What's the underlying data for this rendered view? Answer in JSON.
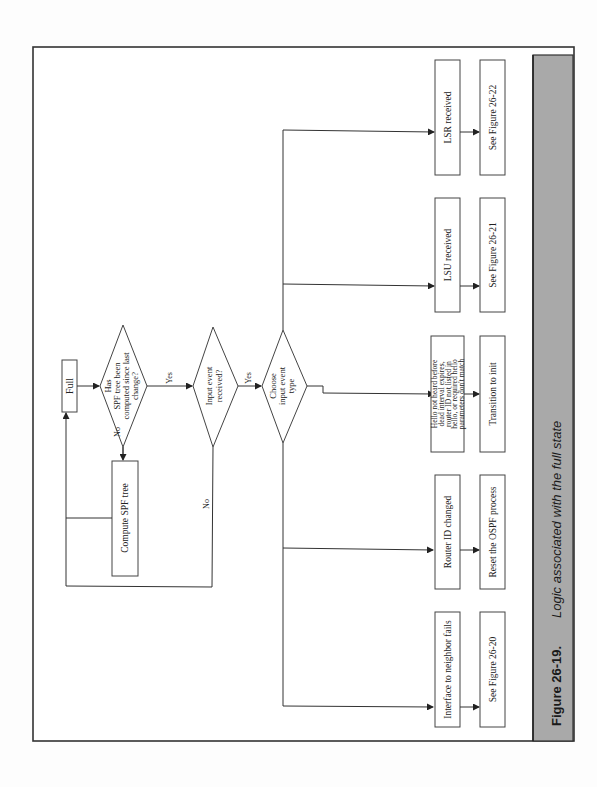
{
  "figure": {
    "number": "Figure 26-19.",
    "caption": "Logic associated with the full state",
    "accent_bar_color": "#a9a9a9"
  },
  "nodes": {
    "start": "Full",
    "decision_spf": [
      "Has",
      "SPF tree been",
      "computed since last",
      "change?"
    ],
    "decision_input": [
      "Input event",
      "received?"
    ],
    "decision_type": [
      "Choose",
      "input event",
      "type"
    ],
    "compute_spf": "Compute SPF tree",
    "events": [
      {
        "event": [
          "Interface to neighbor fails"
        ],
        "action": "See Figure 26-20"
      },
      {
        "event": [
          "Router ID changed"
        ],
        "action": "Reset the OSPF process"
      },
      {
        "event": [
          "Hello not heard before",
          "dead interval expires,",
          "router ID not listed in",
          "hello, or required hello",
          "parameters don't match"
        ],
        "action": "Transition to init"
      },
      {
        "event": [
          "LSU received"
        ],
        "action": "See Figure 26-21"
      },
      {
        "event": [
          "LSR received"
        ],
        "action": "See Figure 26-22"
      }
    ]
  },
  "edge_labels": {
    "spf_yes": "Yes",
    "spf_no": "No",
    "input_yes": "Yes",
    "input_no": "No"
  }
}
